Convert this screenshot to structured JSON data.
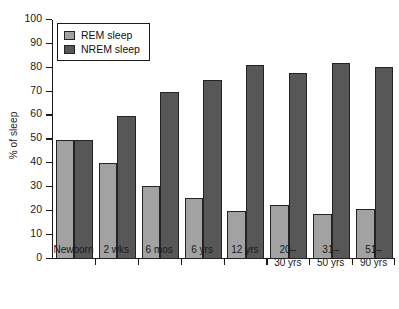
{
  "chart_data": {
    "type": "bar",
    "title": "",
    "xlabel": "",
    "ylabel": "% of sleep",
    "ylim": [
      0,
      100
    ],
    "ytick_values": [
      0,
      10,
      20,
      30,
      40,
      50,
      60,
      70,
      80,
      90,
      100
    ],
    "ytick_labels": [
      "0",
      "10",
      "20",
      "30",
      "40",
      "50",
      "60",
      "70",
      "80",
      "90",
      "100"
    ],
    "grid": false,
    "legend_position": "upper-left-inside",
    "categories": [
      "Newborn",
      "2 wks",
      "6 mos",
      "6 yrs",
      "12 yrs",
      "20–\n30 yrs",
      "31–\n50 yrs",
      "51–\n90 yrs"
    ],
    "series": [
      {
        "name": "REM sleep",
        "color": "#a2a2a2",
        "values": [
          50,
          40,
          30.5,
          25.5,
          20,
          22.5,
          19,
          21
        ]
      },
      {
        "name": "NREM sleep",
        "color": "#575757",
        "values": [
          50,
          60,
          70,
          75,
          81,
          78,
          82,
          80.5
        ]
      }
    ]
  },
  "legend": {
    "items": [
      {
        "label": "REM sleep",
        "swatch": "rem"
      },
      {
        "label": "NREM sleep",
        "swatch": "nrem"
      }
    ]
  },
  "colors": {
    "rem": "#a2a2a2",
    "nrem": "#575757",
    "axis": "#1a1a1a",
    "background": "#ffffff"
  }
}
